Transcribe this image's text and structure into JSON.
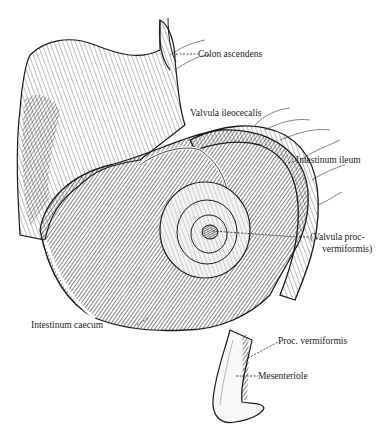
{
  "figure": {
    "colors": {
      "ink": "#1a1a1a",
      "paper": "#ffffff",
      "shade": "#555555"
    },
    "labels": [
      {
        "id": "colon-ascendens",
        "text": "Colon ascendens"
      },
      {
        "id": "valvula-ileocecalis",
        "text": "Valvula ileocecalis"
      },
      {
        "id": "intestinum-ileum",
        "text": "Intestinum ileum"
      },
      {
        "id": "valvula-proc-1",
        "text": "(Valvula proc-"
      },
      {
        "id": "valvula-proc-2",
        "text": "vermiformis)"
      },
      {
        "id": "intestinum-caecum",
        "text": "Intestinum caecum"
      },
      {
        "id": "proc-vermiformis",
        "text": "Proc. vermiformis"
      },
      {
        "id": "mesenteriole",
        "text": "Mesenteriole"
      }
    ]
  }
}
